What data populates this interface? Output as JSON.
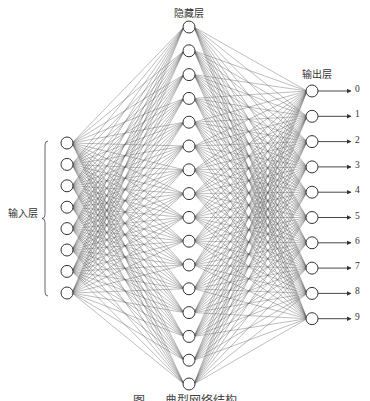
{
  "labels": {
    "hidden_layer": "隐藏层",
    "output_layer": "输出层",
    "input_layer": "输入层"
  },
  "output_classes": [
    "0",
    "1",
    "2",
    "3",
    "4",
    "5",
    "6",
    "7",
    "8",
    "9"
  ],
  "caption": "图 ... 典型网络结构",
  "network": {
    "input": {
      "x": 67,
      "count": 8,
      "ys": [
        143,
        164.4,
        185.8,
        207.2,
        228.6,
        250,
        271.4,
        293
      ]
    },
    "hidden": {
      "x": 189,
      "count": 16,
      "y0": 27,
      "step": 23.8
    },
    "output": {
      "x": 312,
      "count": 10,
      "ys": [
        91,
        116.3,
        141.6,
        166.9,
        192.2,
        217.5,
        242.8,
        268.1,
        293.4,
        318.7
      ]
    },
    "node_radius": 6,
    "edge_color": "#555555",
    "node_stroke": "#333333"
  }
}
